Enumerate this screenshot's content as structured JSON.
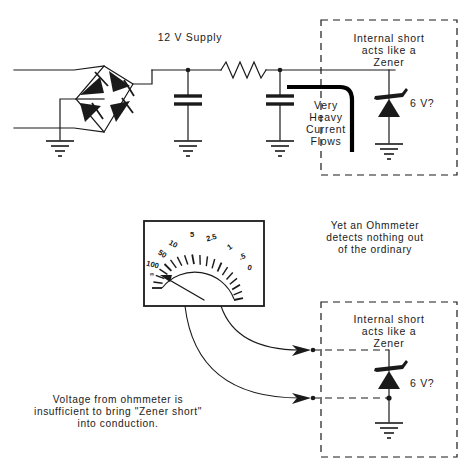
{
  "figure": {
    "supply_label": "12 V Supply"
  },
  "top_circuit": {
    "supply_label": "12 V Supply",
    "short_note_lines": [
      "Very",
      "Heavy",
      "Current",
      "Flows"
    ],
    "dashed_box": {
      "caption_lines": [
        "Internal short",
        "acts like a",
        "Zener"
      ],
      "zener_label": "6 V?"
    }
  },
  "bottom_circuit": {
    "ohmmeter_note_lines": [
      "Yet an Ohmmeter",
      "detects nothing out",
      "of the ordinary"
    ],
    "voltage_note_lines": [
      "Voltage from ohmmeter is",
      "insufficient to bring \"Zener short\"",
      "into conduction."
    ],
    "dashed_box": {
      "caption_lines": [
        "Internal short",
        "acts like a",
        "Zener"
      ],
      "zener_label": "6 V?"
    }
  },
  "meter": {
    "type": "analog-ohmmeter",
    "scale_labels": [
      "0",
      ".5",
      "1",
      "2.5",
      "5",
      "10",
      "50",
      "100",
      "∞"
    ],
    "needle_reading": "∞",
    "needle_position": "far-left"
  },
  "colors": {
    "ink": "#1a1a1a",
    "short_path": "#000000",
    "background": "#ffffff"
  }
}
